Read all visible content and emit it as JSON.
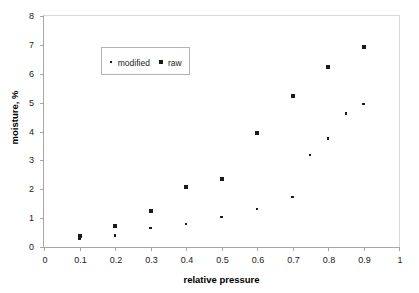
{
  "chart_data": {
    "type": "scatter",
    "title": "",
    "xlabel": "relative pressure",
    "ylabel": "moisture, %",
    "xlim": [
      0,
      1
    ],
    "ylim": [
      0,
      8
    ],
    "xticks": [
      "0",
      "0.1",
      "0.2",
      "0.3",
      "0.4",
      "0.5",
      "0.6",
      "0.7",
      "0.8",
      "0.9",
      "1"
    ],
    "xtick_values": [
      0,
      0.1,
      0.2,
      0.3,
      0.4,
      0.5,
      0.6,
      0.7,
      0.8,
      0.9,
      1
    ],
    "yticks": [
      "0",
      "1",
      "2",
      "3",
      "4",
      "5",
      "6",
      "7",
      "8"
    ],
    "ytick_values": [
      0,
      1,
      2,
      3,
      4,
      5,
      6,
      7,
      8
    ],
    "grid": false,
    "legend_position": "upper-left-inside",
    "marker_color": "#1a1a1a",
    "series": [
      {
        "name": "modified",
        "marker": "dot",
        "points": [
          {
            "x": 0.1,
            "y": 0.3
          },
          {
            "x": 0.2,
            "y": 0.4
          },
          {
            "x": 0.3,
            "y": 0.65
          },
          {
            "x": 0.4,
            "y": 0.79
          },
          {
            "x": 0.5,
            "y": 1.03
          },
          {
            "x": 0.6,
            "y": 1.31
          },
          {
            "x": 0.7,
            "y": 1.74
          },
          {
            "x": 0.75,
            "y": 3.19
          },
          {
            "x": 0.8,
            "y": 3.76
          },
          {
            "x": 0.85,
            "y": 4.62
          },
          {
            "x": 0.9,
            "y": 4.95
          }
        ]
      },
      {
        "name": "raw",
        "marker": "square",
        "points": [
          {
            "x": 0.1,
            "y": 0.38
          },
          {
            "x": 0.2,
            "y": 0.71
          },
          {
            "x": 0.3,
            "y": 1.23
          },
          {
            "x": 0.4,
            "y": 2.08
          },
          {
            "x": 0.5,
            "y": 2.34
          },
          {
            "x": 0.6,
            "y": 3.95
          },
          {
            "x": 0.7,
            "y": 5.22
          },
          {
            "x": 0.8,
            "y": 6.23
          },
          {
            "x": 0.9,
            "y": 6.94
          }
        ]
      }
    ]
  },
  "legend": {
    "entries": [
      {
        "label": "modified"
      },
      {
        "label": "raw"
      }
    ]
  }
}
